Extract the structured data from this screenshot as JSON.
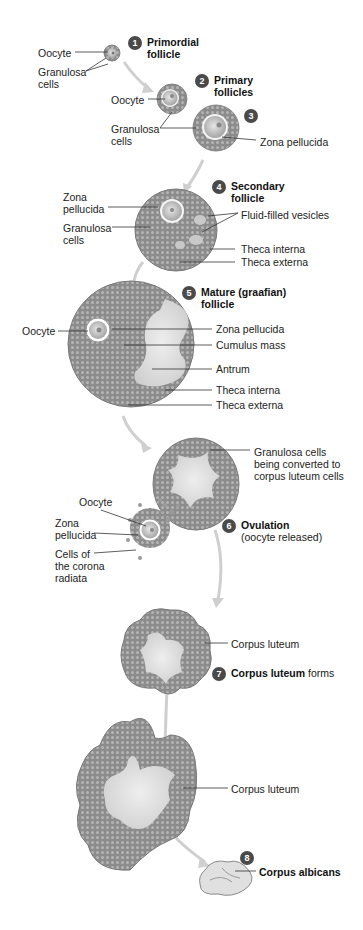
{
  "diagram": {
    "stages": [
      {
        "number": "1",
        "title_bold": "Primordial follicle",
        "title_line1": "Primordial",
        "title_line2": "follicle"
      },
      {
        "number": "2",
        "title_line1": "Primary",
        "title_line2": "follicles"
      },
      {
        "number": "3"
      },
      {
        "number": "4",
        "title_line1": "Secondary",
        "title_line2": "follicle"
      },
      {
        "number": "5",
        "title_line1": "Mature (graafian)",
        "title_line2": "follicle"
      },
      {
        "number": "6",
        "title_bold": "Ovulation",
        "title_rest": "(oocyte released)"
      },
      {
        "number": "7",
        "title_bold": "Corpus luteum",
        "title_rest": "forms"
      },
      {
        "number": "8",
        "title_bold": "Corpus albicans"
      }
    ],
    "labels": {
      "s1_oocyte": "Oocyte",
      "s1_granulosa_1": "Granulosa",
      "s1_granulosa_2": "cells",
      "s2_oocyte": "Oocyte",
      "s2_granulosa_1": "Granulosa",
      "s2_granulosa_2": "cells",
      "s3_zona": "Zona  pellucida",
      "s4_zona_1": "Zona",
      "s4_zona_2": "pellucida",
      "s4_granulosa_1": "Granulosa",
      "s4_granulosa_2": "cells",
      "s4_vesicles": "Fluid-filled vesicles",
      "s4_theca_interna": "Theca interna",
      "s4_theca_externa": "Theca externa",
      "s5_oocyte": "Oocyte",
      "s5_zona": "Zona pellucida",
      "s5_cumulus": "Cumulus mass",
      "s5_antrum": "Antrum",
      "s5_theca_interna": "Theca interna",
      "s5_theca_externa": "Theca externa",
      "s6_granulosa_1": "Granulosa cells",
      "s6_granulosa_2": "being converted to",
      "s6_granulosa_3": "corpus luteum cells",
      "s6_oocyte": "Oocyte",
      "s6_zona_1": "Zona",
      "s6_zona_2": "pellucida",
      "s6_corona_1": "Cells of",
      "s6_corona_2": "the corona",
      "s6_corona_3": "radiata",
      "s7_corpus_luteum": "Corpus luteum",
      "s8_corpus_luteum": "Corpus luteum"
    },
    "colors": {
      "badge": "#4a4a4a",
      "tissue": "#8a8a8a",
      "tissue_dark": "#6e6e6e",
      "antrum": "#dcdcdc",
      "arrow": "#c8c8c8",
      "leader": "#333333"
    }
  }
}
